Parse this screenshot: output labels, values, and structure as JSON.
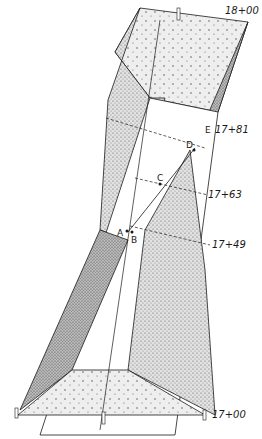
{
  "figure": {
    "type": "perspective engineering drawing of a cut/channel section",
    "stations": [
      {
        "id": "sta-1800",
        "label": "18+00"
      },
      {
        "id": "sta-1781",
        "label": "17+81"
      },
      {
        "id": "sta-1763",
        "label": "17+63"
      },
      {
        "id": "sta-1749",
        "label": "17+49"
      },
      {
        "id": "sta-1700",
        "label": "17+00"
      }
    ],
    "points": [
      {
        "id": "A",
        "label": "A"
      },
      {
        "id": "B",
        "label": "B"
      },
      {
        "id": "C",
        "label": "C"
      },
      {
        "id": "D",
        "label": "D"
      },
      {
        "id": "E",
        "label": "E"
      }
    ],
    "colors": {
      "ink": "#1a1a1a",
      "paper": "#ffffff",
      "shade_dark": "#8a8a8a",
      "shade_mid": "#c8c8c8",
      "shade_light": "#e6e6e6"
    }
  }
}
